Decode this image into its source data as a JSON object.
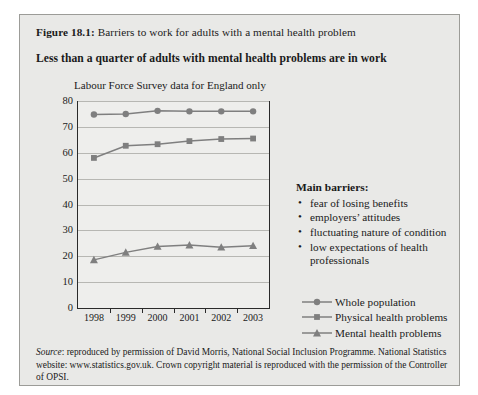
{
  "figure": {
    "label": "Figure 18.1:",
    "title": " Barriers to work for adults with a mental health problem",
    "subtitle": "Less than a quarter of adults with mental health problems are in work"
  },
  "panel": {
    "heading": "Main barriers:",
    "barriers": [
      "fear of losing benefits",
      "employers’ attitudes",
      "fluctuating nature of condition",
      "low expectations of health professionals"
    ]
  },
  "source": {
    "word": "Source",
    "text": ": reproduced by permission of David Morris, National Social Inclusion Programme. National Statistics website: www.statistics.gov.uk. Crown copyright material is reproduced with the permission of the Controller of OPSI."
  },
  "colors": {
    "series": "#7f7f7f",
    "axis": "#2a2a2a",
    "grid": "#b7b7b3",
    "figure_background": "#e9e9e7",
    "plot_background": "#eeeeec"
  },
  "chart_data": {
    "type": "line",
    "title": "Labour Force Survey data for England only",
    "xlabel": "",
    "ylabel": "",
    "categories": [
      "1998",
      "1999",
      "2000",
      "2001",
      "2002",
      "2003"
    ],
    "ylim": [
      0,
      80
    ],
    "yticks": [
      0,
      10,
      20,
      30,
      40,
      50,
      60,
      70,
      80
    ],
    "grid": true,
    "legend_position": "right",
    "series": [
      {
        "name": "Whole population",
        "marker": "circle",
        "color": "#7f7f7f",
        "values": [
          74.8,
          75.0,
          76.2,
          76.0,
          76.0,
          76.0
        ]
      },
      {
        "name": "Physical health problems",
        "marker": "square",
        "color": "#7f7f7f",
        "values": [
          58.0,
          62.7,
          63.3,
          64.5,
          65.3,
          65.5
        ]
      },
      {
        "name": "Mental health problems",
        "marker": "triangle",
        "color": "#7f7f7f",
        "values": [
          18.6,
          21.5,
          23.8,
          24.3,
          23.5,
          24.1
        ]
      }
    ]
  }
}
